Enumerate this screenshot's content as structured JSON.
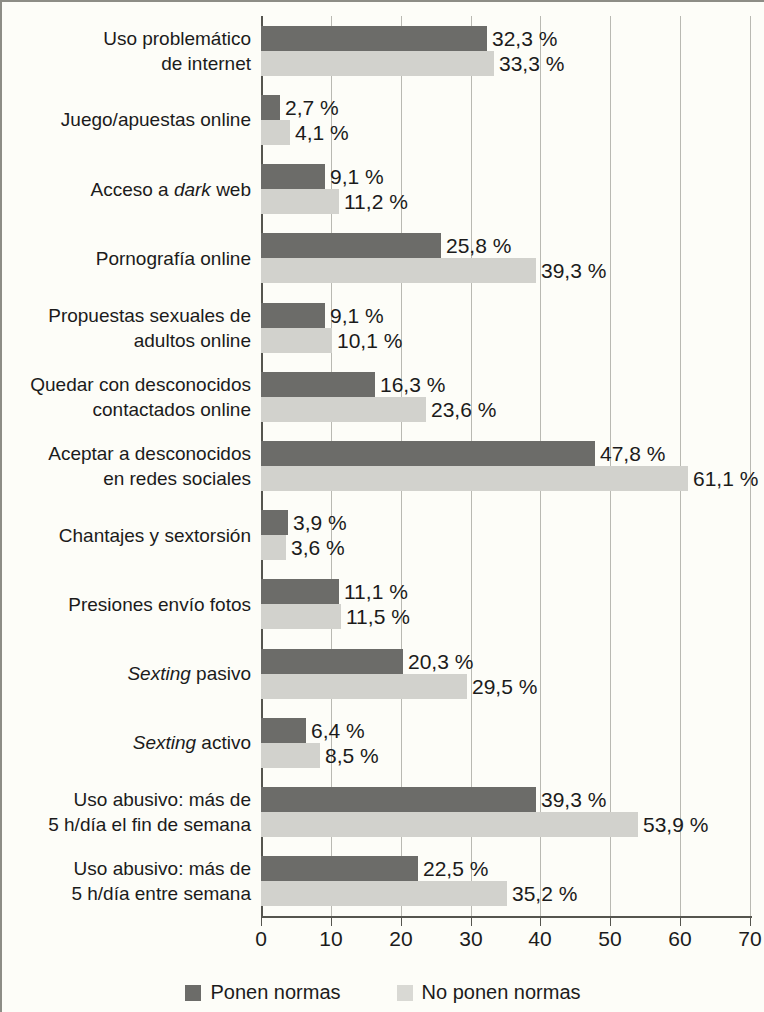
{
  "chart_data": {
    "type": "bar",
    "orientation": "horizontal",
    "title": "",
    "xlabel": "",
    "ylabel": "",
    "xlim": [
      0,
      70
    ],
    "xticks": [
      0,
      10,
      20,
      30,
      40,
      50,
      60,
      70
    ],
    "xtick_labels": [
      "0",
      "10",
      "20",
      "30",
      "40",
      "50",
      "60",
      "70"
    ],
    "grid": "vertical",
    "value_suffix": " %",
    "decimal_separator": ",",
    "legend_position": "bottom",
    "colors": {
      "ponen_normas": "#6c6c69",
      "no_ponen_normas": "#d2d2cd",
      "background": "#fdfdf8",
      "gridline": "#b9b9b2",
      "axis": "#55554f"
    },
    "legend": [
      {
        "label": "Ponen normas",
        "color": "#6c6c69"
      },
      {
        "label": "No ponen normas",
        "color": "#d9d9d4"
      }
    ],
    "series": [
      {
        "name": "Ponen normas",
        "values": [
          32.3,
          2.7,
          9.1,
          25.8,
          9.1,
          16.3,
          47.8,
          3.9,
          11.1,
          20.3,
          6.4,
          39.3,
          22.5
        ],
        "labels": [
          "32,3 %",
          "2,7 %",
          "9,1 %",
          "25,8 %",
          "9,1 %",
          "16,3 %",
          "47,8 %",
          "3,9 %",
          "11,1 %",
          "20,3 %",
          "6,4 %",
          "39,3 %",
          "22,5 %"
        ]
      },
      {
        "name": "No ponen normas",
        "values": [
          33.3,
          4.1,
          11.2,
          39.3,
          10.1,
          23.6,
          61.1,
          3.6,
          11.5,
          29.5,
          8.5,
          53.9,
          35.2
        ],
        "labels": [
          "33,3 %",
          "4,1 %",
          "11,2 %",
          "39,3 %",
          "10,1 %",
          "23,6 %",
          "61,1 %",
          "3,6 %",
          "11,5 %",
          "29,5 %",
          "8,5 %",
          "53,9 %",
          "35,2 %"
        ]
      }
    ],
    "categories": [
      {
        "lines": [
          "Uso problemático",
          "de internet"
        ],
        "italic_words": []
      },
      {
        "lines": [
          "Juego/apuestas online"
        ],
        "italic_words": []
      },
      {
        "lines": [
          "Acceso a dark web"
        ],
        "italic_words": [
          "dark"
        ]
      },
      {
        "lines": [
          "Pornografía online"
        ],
        "italic_words": []
      },
      {
        "lines": [
          "Propuestas sexuales de",
          "adultos online"
        ],
        "italic_words": []
      },
      {
        "lines": [
          "Quedar con desconocidos",
          "contactados online"
        ],
        "italic_words": []
      },
      {
        "lines": [
          "Aceptar a desconocidos",
          "en redes sociales"
        ],
        "italic_words": []
      },
      {
        "lines": [
          "Chantajes y sextorsión"
        ],
        "italic_words": []
      },
      {
        "lines": [
          "Presiones envío fotos"
        ],
        "italic_words": []
      },
      {
        "lines": [
          "Sexting pasivo"
        ],
        "italic_words": [
          "Sexting"
        ]
      },
      {
        "lines": [
          "Sexting activo"
        ],
        "italic_words": [
          "Sexting"
        ]
      },
      {
        "lines": [
          "Uso abusivo: más de",
          "5 h/día el fin de semana"
        ],
        "italic_words": []
      },
      {
        "lines": [
          "Uso abusivo: más de",
          "5 h/día entre semana"
        ],
        "italic_words": []
      }
    ]
  }
}
